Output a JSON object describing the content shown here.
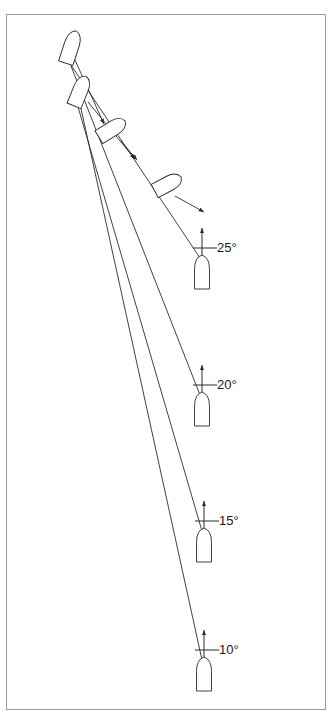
{
  "figure": {
    "background_color": "#ffffff",
    "frame": {
      "name": "figure-border",
      "color": "#9a9a9a",
      "x": 6,
      "y": 14,
      "width": 320,
      "height": 696
    },
    "stroke_color": "#2b2b2b",
    "text_color": "#1a1a1a"
  },
  "angle_markers": [
    {
      "label": "25°",
      "value": 25,
      "unit": "degrees",
      "arrow": {
        "x": 202,
        "y_tail": 268,
        "y_head": 228
      },
      "tick": {
        "x1": 193,
        "x2": 211,
        "y": 248
      },
      "leader": {
        "x1": 211,
        "x2": 217,
        "y": 248
      },
      "text_x": 217,
      "text_y": 241
    },
    {
      "label": "20°",
      "value": 20,
      "unit": "degrees",
      "arrow": {
        "x": 202,
        "y_tail": 405,
        "y_head": 365
      },
      "tick": {
        "x1": 193,
        "x2": 211,
        "y": 385
      },
      "leader": {
        "x1": 211,
        "x2": 217,
        "y": 385
      },
      "text_x": 217,
      "text_y": 378
    },
    {
      "label": "15°",
      "value": 15,
      "unit": "degrees",
      "arrow": {
        "x": 204,
        "y_tail": 541,
        "y_head": 501
      },
      "tick": {
        "x1": 195,
        "x2": 213,
        "y": 521
      },
      "leader": {
        "x1": 213,
        "x2": 219,
        "y": 521
      },
      "text_x": 219,
      "text_y": 514
    },
    {
      "label": "10°",
      "value": 10,
      "unit": "degrees",
      "arrow": {
        "x": 204,
        "y_tail": 670,
        "y_head": 630
      },
      "tick": {
        "x1": 195,
        "x2": 213,
        "y": 650
      },
      "leader": {
        "x1": 213,
        "x2": 219,
        "y": 650
      },
      "text_x": 219,
      "text_y": 643
    }
  ],
  "launch_rockets": [
    {
      "name": "rocket-launch-25",
      "cx": 202,
      "cy": 272,
      "angle": 0,
      "len": 34,
      "w": 15
    },
    {
      "name": "rocket-launch-20",
      "cx": 202,
      "cy": 409,
      "angle": 0,
      "len": 34,
      "w": 15
    },
    {
      "name": "rocket-launch-15",
      "cx": 204,
      "cy": 545,
      "angle": 0,
      "len": 34,
      "w": 15
    },
    {
      "name": "rocket-launch-10",
      "cx": 204,
      "cy": 674,
      "angle": 0,
      "len": 34,
      "w": 15
    }
  ],
  "terminal_rockets": [
    {
      "name": "rocket-terminal-a",
      "cx": 71,
      "cy": 47,
      "angle": 18,
      "len": 34,
      "w": 15
    },
    {
      "name": "rocket-terminal-b",
      "cx": 80,
      "cy": 91,
      "angle": 22,
      "len": 32,
      "w": 15
    },
    {
      "name": "rocket-terminal-c",
      "cx": 112,
      "cy": 129,
      "angle": 58,
      "len": 31,
      "w": 15
    },
    {
      "name": "rocket-terminal-d",
      "cx": 168,
      "cy": 184,
      "angle": 62,
      "len": 30,
      "w": 15
    }
  ],
  "trajectories": [
    {
      "name": "trajectory-25",
      "x1": 69,
      "y1": 62,
      "x2": 200,
      "y2": 258
    },
    {
      "name": "trajectory-20",
      "x1": 71,
      "y1": 66,
      "x2": 200,
      "y2": 395
    },
    {
      "name": "trajectory-15",
      "x1": 76,
      "y1": 100,
      "x2": 202,
      "y2": 531
    },
    {
      "name": "trajectory-10",
      "x1": 80,
      "y1": 104,
      "x2": 202,
      "y2": 660
    }
  ],
  "velocity_arrows": [
    {
      "name": "velocity-arrow-a",
      "x1": 75,
      "y1": 60,
      "x2": 104,
      "y2": 124
    },
    {
      "name": "velocity-arrow-b",
      "x1": 88,
      "y1": 102,
      "x2": 135,
      "y2": 159
    },
    {
      "name": "velocity-arrow-c",
      "x1": 121,
      "y1": 141,
      "x2": 137,
      "y2": 160
    },
    {
      "name": "velocity-arrow-d",
      "x1": 175,
      "y1": 196,
      "x2": 204,
      "y2": 212
    }
  ]
}
